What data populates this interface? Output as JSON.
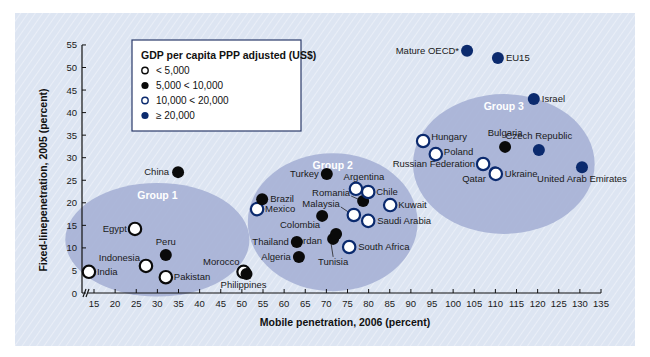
{
  "chart_data": {
    "type": "scatter",
    "title": "",
    "xlabel": "Mobile penetration, 2006 (percent)",
    "ylabel": "Fixed-linepenetration, 2005 (percent)",
    "xlim": [
      12,
      135
    ],
    "ylim": [
      0,
      55
    ],
    "x_ticks": [
      15,
      20,
      25,
      30,
      35,
      40,
      45,
      50,
      55,
      60,
      65,
      70,
      75,
      80,
      85,
      90,
      95,
      100,
      105,
      110,
      115,
      120,
      125,
      130,
      135
    ],
    "y_ticks": [
      0,
      5,
      10,
      15,
      20,
      25,
      30,
      35,
      40,
      45,
      50,
      55
    ],
    "x_axis_break": true,
    "grid": false,
    "legend": {
      "title": "GDP per capita PPP adjusted (US$)",
      "position": "top-left",
      "entries": [
        {
          "key": "lt5k",
          "label": "< 5,000",
          "style": "white-fill-black-outline"
        },
        {
          "key": "5k10k",
          "label": "5,000 < 10,000",
          "style": "black-fill"
        },
        {
          "key": "10k20k",
          "label": "10,000 < 20,000",
          "style": "white-fill-navy-outline"
        },
        {
          "key": "ge20k",
          "label": "≥ 20,000",
          "style": "navy-fill"
        }
      ]
    },
    "groups": [
      {
        "name": "Group 1",
        "cx": 30,
        "cy": 11.8,
        "rx": 21.8,
        "ry": 12.6
      },
      {
        "name": "Group 2",
        "cx": 71.5,
        "cy": 15.7,
        "rx": 20.1,
        "ry": 15.3
      },
      {
        "name": "Group 3",
        "cx": 112,
        "cy": 28.6,
        "rx": 21.5,
        "ry": 15.5
      }
    ],
    "points": [
      {
        "name": "India",
        "x": 13.8,
        "y": 4.7,
        "cat": "lt5k",
        "lx": 8,
        "ly": 3,
        "anchor": "start"
      },
      {
        "name": "Egypt",
        "x": 24.7,
        "y": 14.2,
        "cat": "lt5k",
        "lx": -8,
        "ly": 3,
        "anchor": "end"
      },
      {
        "name": "Indonesia",
        "x": 27.3,
        "y": 6.0,
        "cat": "lt5k",
        "lx": -6,
        "ly": -5,
        "anchor": "end"
      },
      {
        "name": "Pakistan",
        "x": 32.0,
        "y": 3.5,
        "cat": "lt5k",
        "lx": 8,
        "ly": 3,
        "anchor": "start"
      },
      {
        "name": "Peru",
        "x": 32.0,
        "y": 8.4,
        "cat": "5k10k",
        "lx": 0,
        "ly": -10,
        "anchor": "middle"
      },
      {
        "name": "China",
        "x": 34.9,
        "y": 26.8,
        "cat": "5k10k",
        "lx": -9,
        "ly": 3,
        "anchor": "end"
      },
      {
        "name": "Philippines",
        "x": 50.4,
        "y": 4.7,
        "cat": "lt5k",
        "lx": 0,
        "ly": 16,
        "anchor": "middle"
      },
      {
        "name": "Morocco",
        "x": 51.1,
        "y": 4.2,
        "cat": "5k10k",
        "lx": -7,
        "ly": -9,
        "anchor": "end"
      },
      {
        "name": "Mexico",
        "x": 53.6,
        "y": 18.6,
        "cat": "10k20k",
        "lx": 8,
        "ly": 3,
        "anchor": "start"
      },
      {
        "name": "Brazil",
        "x": 54.8,
        "y": 20.8,
        "cat": "5k10k",
        "lx": 8,
        "ly": 3,
        "anchor": "start"
      },
      {
        "name": "Thailand",
        "x": 63.0,
        "y": 11.3,
        "cat": "5k10k",
        "lx": -8,
        "ly": 3,
        "anchor": "end"
      },
      {
        "name": "Algeria",
        "x": 63.5,
        "y": 8.0,
        "cat": "5k10k",
        "lx": -8,
        "ly": 3,
        "anchor": "end"
      },
      {
        "name": "Colombia",
        "x": 69.0,
        "y": 17.1,
        "cat": "5k10k",
        "lx": -2,
        "ly": 12,
        "anchor": "end"
      },
      {
        "name": "Turkey",
        "x": 70.1,
        "y": 26.4,
        "cat": "5k10k",
        "lx": -8,
        "ly": 3,
        "anchor": "end"
      },
      {
        "name": "Tunisia",
        "x": 71.6,
        "y": 12.0,
        "cat": "5k10k",
        "lx": 0,
        "ly": 26,
        "anchor": "middle"
      },
      {
        "name": "Jordan",
        "x": 72.3,
        "y": 13.1,
        "cat": "5k10k",
        "lx": -14,
        "ly": 10,
        "anchor": "end"
      },
      {
        "name": "South Africa",
        "x": 75.4,
        "y": 10.2,
        "cat": "10k20k",
        "lx": 9,
        "ly": 3,
        "anchor": "start"
      },
      {
        "name": "Malaysia",
        "x": 76.5,
        "y": 17.3,
        "cat": "10k20k",
        "lx": -14,
        "ly": -8,
        "anchor": "end"
      },
      {
        "name": "Argentina",
        "x": 77.0,
        "y": 23.1,
        "cat": "10k20k",
        "lx": 8,
        "ly": -9,
        "anchor": "middle"
      },
      {
        "name": "Romania",
        "x": 78.7,
        "y": 20.4,
        "cat": "5k10k",
        "lx": -13,
        "ly": -5,
        "anchor": "end"
      },
      {
        "name": "Chile",
        "x": 79.9,
        "y": 22.4,
        "cat": "10k20k",
        "lx": 8,
        "ly": 3,
        "anchor": "start"
      },
      {
        "name": "Saudi Arabia",
        "x": 79.9,
        "y": 16.0,
        "cat": "10k20k",
        "lx": 9,
        "ly": 3,
        "anchor": "start"
      },
      {
        "name": "Kuwait",
        "x": 85.1,
        "y": 19.5,
        "cat": "10k20k",
        "lx": 8,
        "ly": 3,
        "anchor": "start"
      },
      {
        "name": "Hungary",
        "x": 92.9,
        "y": 33.7,
        "cat": "10k20k",
        "lx": 8,
        "ly": -1,
        "anchor": "start"
      },
      {
        "name": "Poland",
        "x": 95.9,
        "y": 30.8,
        "cat": "10k20k",
        "lx": 8,
        "ly": 1,
        "anchor": "start"
      },
      {
        "name": "Mature OECD*",
        "x": 103.3,
        "y": 53.7,
        "cat": "ge20k",
        "lx": -8,
        "ly": 3,
        "anchor": "end"
      },
      {
        "name": "Russian Federation",
        "x": 107.1,
        "y": 28.6,
        "cat": "10k20k",
        "lx": -8,
        "ly": 3,
        "anchor": "end"
      },
      {
        "name": "Qatar",
        "x": 109.9,
        "y": 26.8,
        "cat": "ge20k",
        "lx": -9,
        "ly": 10,
        "anchor": "end"
      },
      {
        "name": "Ukraine",
        "x": 110.1,
        "y": 26.4,
        "cat": "10k20k",
        "lx": 9,
        "ly": 3,
        "anchor": "start"
      },
      {
        "name": "EU15",
        "x": 110.6,
        "y": 52.1,
        "cat": "ge20k",
        "lx": 8,
        "ly": 3,
        "anchor": "start"
      },
      {
        "name": "Bulgaria",
        "x": 112.3,
        "y": 32.4,
        "cat": "5k10k",
        "lx": 0,
        "ly": -11,
        "anchor": "middle"
      },
      {
        "name": "Israel",
        "x": 119.1,
        "y": 43.0,
        "cat": "ge20k",
        "lx": 8,
        "ly": 3,
        "anchor": "start"
      },
      {
        "name": "Czech Republic",
        "x": 120.3,
        "y": 31.7,
        "cat": "ge20k",
        "lx": 0,
        "ly": -11,
        "anchor": "middle"
      },
      {
        "name": "United Arab Emirates",
        "x": 130.5,
        "y": 27.9,
        "cat": "ge20k",
        "lx": 0,
        "ly": 15,
        "anchor": "middle"
      }
    ],
    "colors": {
      "navy": "#0b2a6e",
      "black": "#0a0a0a",
      "white": "#ffffff",
      "panel_bg": "#dde5f2",
      "ellipse_fill": "#a7b2d6"
    }
  }
}
